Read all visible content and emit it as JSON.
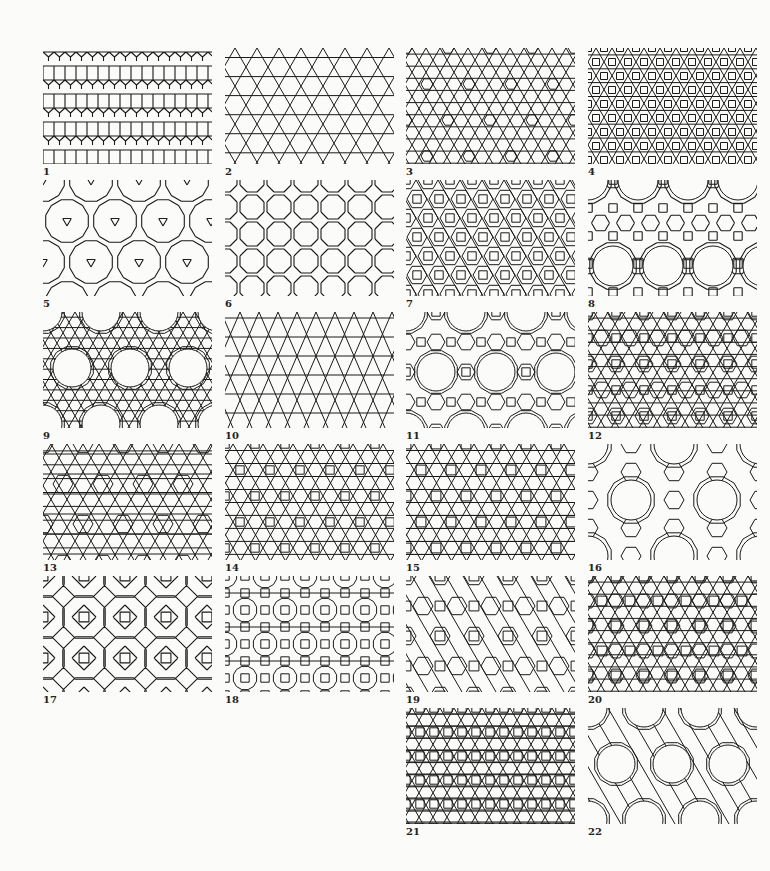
{
  "figure": {
    "title": "",
    "ink_color": "#1a1a1a",
    "background_color": "#fbfbfa"
  },
  "panels": [
    {
      "id": 1,
      "label": "1",
      "pattern": "elongated-triangular",
      "col": 0,
      "row": 0
    },
    {
      "id": 2,
      "label": "2",
      "pattern": "trihexagonal",
      "col": 1,
      "row": 0
    },
    {
      "id": 3,
      "label": "3",
      "pattern": "triangle-hexagon-2uniform",
      "col": 2,
      "row": 0
    },
    {
      "id": 4,
      "label": "4",
      "pattern": "snub-square-variant",
      "col": 3,
      "row": 0
    },
    {
      "id": 5,
      "label": "5",
      "pattern": "truncated-hexagonal",
      "col": 0,
      "row": 1
    },
    {
      "id": 6,
      "label": "6",
      "pattern": "truncated-square",
      "col": 1,
      "row": 1
    },
    {
      "id": 7,
      "label": "7",
      "pattern": "square-hexagon-triangle-dense",
      "col": 2,
      "row": 1
    },
    {
      "id": 8,
      "label": "8",
      "pattern": "truncated-trihexagonal",
      "col": 3,
      "row": 1
    },
    {
      "id": 9,
      "label": "9",
      "pattern": "dodecagon-hexagram",
      "col": 0,
      "row": 2
    },
    {
      "id": 10,
      "label": "10",
      "pattern": "rhombic-triangle-strip",
      "col": 1,
      "row": 2
    },
    {
      "id": 11,
      "label": "11",
      "pattern": "dodecagon-square-triangle",
      "col": 2,
      "row": 2
    },
    {
      "id": 12,
      "label": "12",
      "pattern": "dense-square-triangle-hex",
      "col": 3,
      "row": 2
    },
    {
      "id": 13,
      "label": "13",
      "pattern": "rhombitrihexagonal-variant",
      "col": 0,
      "row": 3
    },
    {
      "id": 14,
      "label": "14",
      "pattern": "square-triangle-mixed",
      "col": 1,
      "row": 3
    },
    {
      "id": 15,
      "label": "15",
      "pattern": "hexagram-square-dense",
      "col": 2,
      "row": 3
    },
    {
      "id": 16,
      "label": "16",
      "pattern": "dodecagon-hexagram-square",
      "col": 3,
      "row": 3
    },
    {
      "id": 17,
      "label": "17",
      "pattern": "octagon-star-square",
      "col": 0,
      "row": 4
    },
    {
      "id": 18,
      "label": "18",
      "pattern": "square-hexagon-rosette",
      "col": 1,
      "row": 4
    },
    {
      "id": 19,
      "label": "19",
      "pattern": "hexagon-square-triangle-rows",
      "col": 2,
      "row": 4
    },
    {
      "id": 20,
      "label": "20",
      "pattern": "dense-hexagram-square",
      "col": 3,
      "row": 4
    },
    {
      "id": 21,
      "label": "21",
      "pattern": "square-triangle-grid",
      "col": 2,
      "row": 5
    },
    {
      "id": 22,
      "label": "22",
      "pattern": "dodecagon-ring",
      "col": 3,
      "row": 5
    }
  ],
  "layout": {
    "col_x": [
      43,
      225,
      406,
      588
    ],
    "row_y": [
      48,
      180,
      312,
      444,
      576,
      708
    ],
    "panel_w": 169,
    "panel_h": 116
  }
}
